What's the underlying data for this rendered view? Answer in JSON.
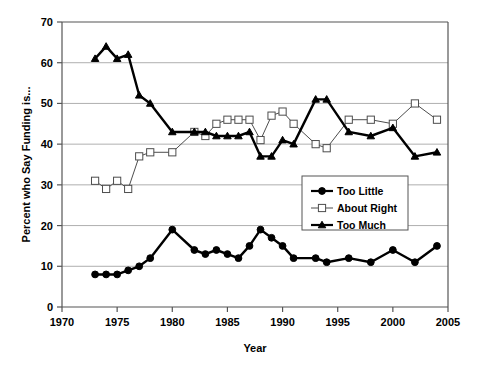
{
  "chart_data": {
    "type": "line",
    "title": "",
    "xlabel": "Year",
    "ylabel": "Percent who Say Funding is...",
    "xlim": [
      1970,
      2005
    ],
    "ylim": [
      0,
      70
    ],
    "xticks": [
      1970,
      1975,
      1980,
      1985,
      1990,
      1995,
      2000,
      2005
    ],
    "yticks": [
      0,
      10,
      20,
      30,
      40,
      50,
      60,
      70
    ],
    "grid": "horizontal",
    "legend_position": "center-right-inside",
    "series": [
      {
        "name": "Too Little",
        "marker": "filled-circle",
        "color": "#000000",
        "x": [
          1973,
          1974,
          1975,
          1976,
          1977,
          1978,
          1980,
          1982,
          1983,
          1984,
          1985,
          1986,
          1987,
          1988,
          1989,
          1990,
          1991,
          1993,
          1994,
          1996,
          1998,
          2000,
          2002,
          2004
        ],
        "values": [
          8,
          8,
          8,
          9,
          10,
          12,
          19,
          14,
          13,
          14,
          13,
          12,
          15,
          19,
          17,
          15,
          12,
          12,
          11,
          12,
          11,
          14,
          11,
          15
        ]
      },
      {
        "name": "About Right",
        "marker": "open-square",
        "color": "#000000",
        "x": [
          1973,
          1974,
          1975,
          1976,
          1977,
          1978,
          1980,
          1982,
          1983,
          1984,
          1985,
          1986,
          1987,
          1988,
          1989,
          1990,
          1991,
          1993,
          1994,
          1996,
          1998,
          2000,
          2002,
          2004
        ],
        "values": [
          31,
          29,
          31,
          29,
          37,
          38,
          38,
          43,
          42,
          45,
          46,
          46,
          46,
          41,
          47,
          48,
          45,
          40,
          39,
          46,
          46,
          45,
          50,
          46
        ]
      },
      {
        "name": "Too Much",
        "marker": "filled-triangle",
        "color": "#000000",
        "x": [
          1973,
          1974,
          1975,
          1976,
          1977,
          1978,
          1980,
          1982,
          1983,
          1984,
          1985,
          1986,
          1987,
          1988,
          1989,
          1990,
          1991,
          1993,
          1994,
          1996,
          1998,
          2000,
          2002,
          2004
        ],
        "values": [
          61,
          64,
          61,
          62,
          52,
          50,
          43,
          43,
          43,
          42,
          42,
          42,
          43,
          37,
          37,
          41,
          40,
          51,
          51,
          43,
          42,
          44,
          37,
          38
        ]
      }
    ]
  },
  "axis": {
    "ylabel": "Percent who Say Funding is...",
    "xlabel": "Year",
    "yticks": [
      "0",
      "10",
      "20",
      "30",
      "40",
      "50",
      "60",
      "70"
    ],
    "xticks": [
      "1970",
      "1975",
      "1980",
      "1985",
      "1990",
      "1995",
      "2000",
      "2005"
    ]
  },
  "legend": {
    "items": [
      {
        "label": "Too Little",
        "marker": "filled-circle"
      },
      {
        "label": "About Right",
        "marker": "open-square"
      },
      {
        "label": "Too Much",
        "marker": "filled-triangle"
      }
    ]
  }
}
